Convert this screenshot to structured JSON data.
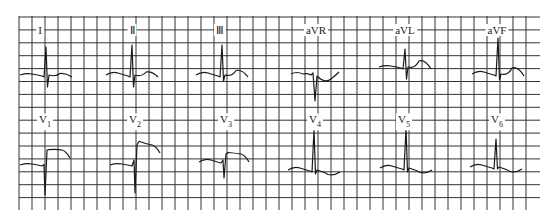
{
  "figure": {
    "grid": {
      "x_start": 19,
      "x_end": 530,
      "x_step": 13,
      "y_start": 16,
      "y_end": 210,
      "y_step": 12.9,
      "line_color": "#333333"
    },
    "trace_color": "#1a1a1a",
    "leads": [
      {
        "id": "I",
        "label": "I",
        "sub": "",
        "label_x": 40,
        "label_y": 30,
        "cx": 46,
        "cy": 75,
        "r": 28,
        "s": 12,
        "t": 1,
        "p": 1,
        "st": 0,
        "morph": "rS"
      },
      {
        "id": "II",
        "label": "Ⅱ",
        "sub": "",
        "label_x": 132,
        "label_y": 30,
        "cx": 132,
        "cy": 75,
        "r": 30,
        "s": 12,
        "t": 2,
        "p": 2,
        "st": 0,
        "morph": "qRs"
      },
      {
        "id": "III",
        "label": "Ⅲ",
        "sub": "",
        "label_x": 220,
        "label_y": 30,
        "cx": 222,
        "cy": 75,
        "r": 30,
        "s": 6,
        "t": 3,
        "p": 2,
        "st": 0,
        "morph": "qRs"
      },
      {
        "id": "aVR",
        "label": "aVR",
        "sub": "",
        "label_x": 316,
        "label_y": 30,
        "cx": 315,
        "cy": 76,
        "r": 3,
        "s": 25,
        "t": -3,
        "p": -2,
        "st": 0,
        "morph": "QS"
      },
      {
        "id": "aVL",
        "label": "aVL",
        "sub": "",
        "label_x": 405,
        "label_y": 30,
        "cx": 405,
        "cy": 67,
        "r": 18,
        "s": 12,
        "t": 4,
        "p": 1,
        "st": 0,
        "morph": "qRs"
      },
      {
        "id": "aVF",
        "label": "aVF",
        "sub": "",
        "label_x": 497,
        "label_y": 30,
        "cx": 498,
        "cy": 74,
        "r": 36,
        "s": 6,
        "t": 4,
        "p": 2,
        "st": 0,
        "morph": "qRs"
      },
      {
        "id": "V1",
        "label": "V",
        "sub": "1",
        "label_x": 45,
        "label_y": 122,
        "cx": 46,
        "cy": 165,
        "r": 2,
        "s": 30,
        "t": 0,
        "p": 1,
        "st": 15,
        "morph": "rSR-plateau"
      },
      {
        "id": "V2",
        "label": "V",
        "sub": "2",
        "label_x": 135,
        "label_y": 122,
        "cx": 136,
        "cy": 165,
        "r": 25,
        "s": 28,
        "t": 0,
        "p": 1,
        "st": 20,
        "morph": "RS-plateau"
      },
      {
        "id": "V3",
        "label": "V",
        "sub": "3",
        "label_x": 226,
        "label_y": 122,
        "cx": 225,
        "cy": 162,
        "r": 10,
        "s": 16,
        "t": 0,
        "p": 2,
        "st": 8,
        "morph": "rS-plateau"
      },
      {
        "id": "V4",
        "label": "V",
        "sub": "4",
        "label_x": 315,
        "label_y": 122,
        "cx": 314,
        "cy": 170,
        "r": 40,
        "s": 4,
        "t": -3,
        "p": 2,
        "st": 0,
        "morph": "qR"
      },
      {
        "id": "V5",
        "label": "V",
        "sub": "5",
        "label_x": 404,
        "label_y": 122,
        "cx": 406,
        "cy": 168,
        "r": 40,
        "s": 4,
        "t": -3,
        "p": 2,
        "st": 0,
        "morph": "qR"
      },
      {
        "id": "V6",
        "label": "V",
        "sub": "6",
        "label_x": 497,
        "label_y": 122,
        "cx": 496,
        "cy": 167,
        "r": 28,
        "s": 2,
        "t": -3,
        "p": 2,
        "st": 0,
        "morph": "qR"
      }
    ]
  }
}
